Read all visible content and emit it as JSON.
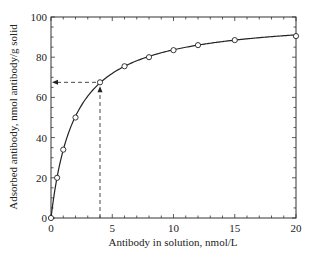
{
  "chart_data": {
    "type": "line",
    "title": "",
    "xlabel": "Antibody in solution, nmol/L",
    "ylabel": "Adsorbed antibody, nmol antibody/g solid",
    "xlim": [
      0,
      20
    ],
    "ylim": [
      0,
      100
    ],
    "x_ticks": [
      "0",
      "5",
      "10",
      "15",
      "20"
    ],
    "y_ticks": [
      "0",
      "20",
      "40",
      "60",
      "80",
      "100"
    ],
    "grid": false,
    "legend": null,
    "series": [
      {
        "name": "Adsorption isotherm",
        "marker": "open-circle",
        "x": [
          0,
          0.5,
          1,
          2,
          4,
          6,
          8,
          10,
          12,
          15,
          20
        ],
        "y": [
          0,
          20,
          34,
          50,
          67.5,
          75.5,
          80,
          83.5,
          86,
          88.5,
          90.5
        ]
      }
    ],
    "annotations": [
      {
        "type": "dashed-arrow",
        "from": [
          4,
          0
        ],
        "to": [
          4,
          67.5
        ],
        "direction": "up"
      },
      {
        "type": "dashed-arrow",
        "from": [
          4,
          67.5
        ],
        "to": [
          0,
          67.5
        ],
        "direction": "left"
      }
    ]
  },
  "labels": {
    "xlabel": "Antibody in solution, nmol/L",
    "ylabel": "Adsorbed antibody, nmol antibody/g solid"
  }
}
